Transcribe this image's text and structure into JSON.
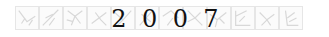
{
  "banner": {
    "year_digits": [
      "2",
      "0",
      "0",
      "7"
    ],
    "tile_count": 12,
    "tile_icons": [
      "bird-sketch-icon",
      "bird-sketch-icon",
      "bird-sketch-icon",
      "bird-sketch-icon",
      "bird-sketch-icon",
      "bird-sketch-icon",
      "bird-sketch-icon",
      "bird-sketch-icon",
      "bird-sketch-icon",
      "bird-sketch-icon",
      "bird-sketch-icon",
      "bird-sketch-icon"
    ],
    "colors": {
      "background": "#ffffff",
      "tile_border": "#e6e6e6",
      "tile_sketch": "#d8d8d8",
      "year_text": "#111111"
    }
  }
}
